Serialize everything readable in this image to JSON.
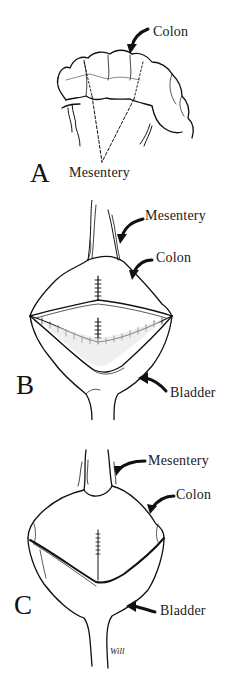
{
  "figure": {
    "panels": [
      {
        "id": "A",
        "letter": "A",
        "labels": {
          "colon": "Colon",
          "mesentery": "Mesentery"
        }
      },
      {
        "id": "B",
        "letter": "B",
        "labels": {
          "mesentery": "Mesentery",
          "colon": "Colon",
          "bladder": "Bladder"
        }
      },
      {
        "id": "C",
        "letter": "C",
        "labels": {
          "mesentery": "Mesentery",
          "colon": "Colon",
          "bladder": "Bladder"
        }
      }
    ],
    "signature": "Will",
    "stroke_color": "#111111",
    "background": "#ffffff"
  }
}
